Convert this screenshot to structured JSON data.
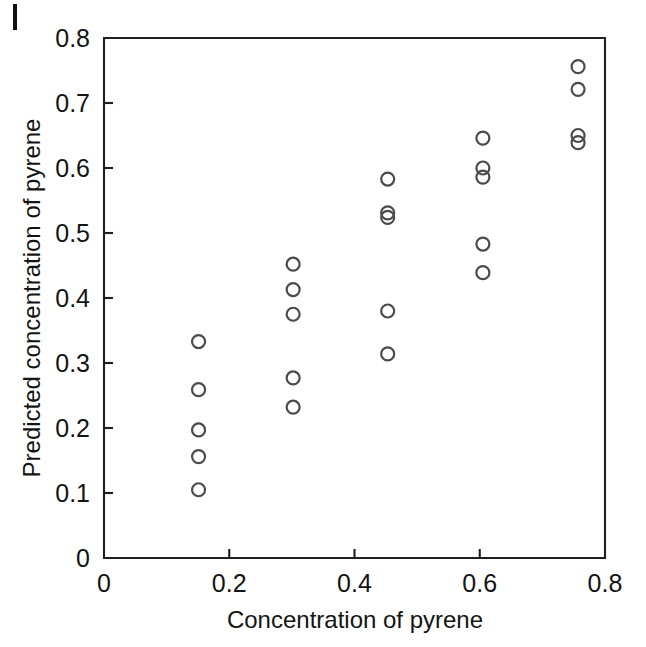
{
  "figure": {
    "background": "#ffffff",
    "ink_color": "#1f1f1f",
    "marker_color": "#4a4a4f",
    "scan_artifact": true
  },
  "chart_data": {
    "type": "scatter",
    "title": "",
    "xlabel": "Concentration of pyrene",
    "ylabel": "Predicted concentration of pyrene",
    "xlim": [
      0,
      0.8
    ],
    "ylim": [
      0,
      0.8
    ],
    "xticks": [
      0,
      0.2,
      0.4,
      0.6,
      0.8
    ],
    "xticklabels": [
      "0",
      "0.2",
      "0.4",
      "0.6",
      "0.8"
    ],
    "yticks": [
      0,
      0.1,
      0.2,
      0.3,
      0.4,
      0.5,
      0.6,
      0.7,
      0.8
    ],
    "yticklabels": [
      "0",
      "0.1",
      "0.2",
      "0.3",
      "0.4",
      "0.5",
      "0.6",
      "0.7",
      "0.8"
    ],
    "grid": false,
    "legend": false,
    "marker_style": "open-circle",
    "marker_radius_px": 6.5,
    "series": [
      {
        "name": "predicted vs actual pyrene",
        "x": [
          0.151,
          0.151,
          0.151,
          0.151,
          0.151,
          0.302,
          0.302,
          0.302,
          0.302,
          0.302,
          0.453,
          0.453,
          0.453,
          0.453,
          0.453,
          0.605,
          0.605,
          0.605,
          0.605,
          0.605,
          0.757,
          0.757,
          0.757,
          0.757
        ],
        "y": [
          0.333,
          0.259,
          0.197,
          0.156,
          0.105,
          0.452,
          0.413,
          0.375,
          0.277,
          0.232,
          0.583,
          0.531,
          0.524,
          0.38,
          0.314,
          0.646,
          0.6,
          0.586,
          0.483,
          0.439,
          0.756,
          0.721,
          0.65,
          0.639
        ]
      }
    ],
    "clusters": [
      {
        "x": 0.151,
        "count": 5,
        "y_values": [
          0.333,
          0.259,
          0.197,
          0.156,
          0.105
        ]
      },
      {
        "x": 0.302,
        "count": 5,
        "y_values": [
          0.452,
          0.413,
          0.375,
          0.277,
          0.232
        ]
      },
      {
        "x": 0.453,
        "count": 5,
        "y_values": [
          0.583,
          0.531,
          0.524,
          0.38,
          0.314
        ]
      },
      {
        "x": 0.605,
        "count": 5,
        "y_values": [
          0.646,
          0.6,
          0.586,
          0.483,
          0.439
        ]
      },
      {
        "x": 0.757,
        "count": 4,
        "y_values": [
          0.756,
          0.721,
          0.65,
          0.639
        ]
      }
    ]
  }
}
